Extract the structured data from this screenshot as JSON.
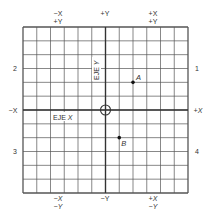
{
  "diagram": {
    "grid": {
      "columns": 12,
      "rows": 12,
      "origin_col": 6,
      "origin_row": 6
    },
    "axis_titles": {
      "x": {
        "text": "EJE",
        "var": "X"
      },
      "y": {
        "text": "EJE",
        "var": "Y"
      }
    },
    "edge_labels": {
      "left": "−X",
      "right": "+X",
      "top": "+Y",
      "bottom": "−Y"
    },
    "corner_labels": {
      "top_left": [
        "−X",
        "+Y"
      ],
      "top_right": [
        "+X",
        "+Y"
      ],
      "bottom_left": [
        "−X",
        "−Y"
      ],
      "bottom_right": [
        "+X",
        "−Y"
      ]
    },
    "quadrants": {
      "top_right": "1",
      "top_left": "2",
      "bottom_left": "3",
      "bottom_right": "4"
    },
    "points": [
      {
        "label": "A",
        "x": 2,
        "y": 2
      },
      {
        "label": "B",
        "x": 1,
        "y": -2
      }
    ],
    "colors": {
      "grid": "#555555",
      "axis": "#333333",
      "text": "#333333",
      "point": "#111111"
    }
  }
}
